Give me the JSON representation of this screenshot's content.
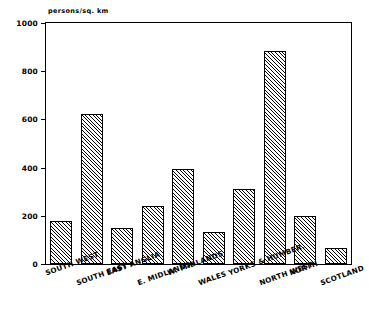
{
  "title": "",
  "axis": {
    "y_caption": "persons/sq. km",
    "y_ticks": [
      "0",
      "200",
      "400",
      "600",
      "800",
      "1000"
    ]
  },
  "chart_data": {
    "type": "bar",
    "title": "",
    "subtitle": "",
    "xlabel": "",
    "ylabel": "persons/sq. km",
    "ylim": [
      0,
      1000
    ],
    "ytick_values": [
      0,
      200,
      400,
      600,
      800,
      1000
    ],
    "grid": false,
    "legend": "none",
    "categories": [
      "SOUTH WEST",
      "SOUTH EAST",
      "EAST ANGLIA",
      "E. MIDLANDS",
      "W. MIDLANDS",
      "WALES",
      "YORKS & HUMBER.",
      "NORTH WEST",
      "NORTH",
      "SCOTLAND"
    ],
    "values": [
      178,
      622,
      150,
      242,
      393,
      132,
      313,
      885,
      200,
      68
    ],
    "bar_fill": "diagonal-hatch",
    "bar_edge_color": "#000000"
  }
}
